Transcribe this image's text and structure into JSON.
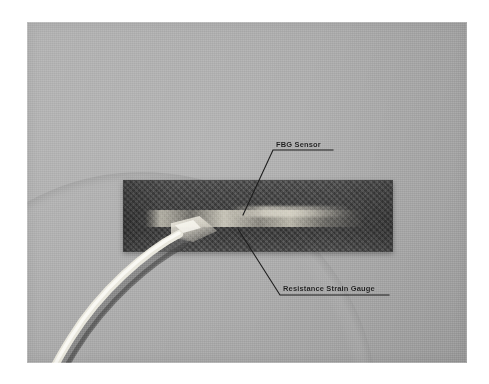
{
  "figure": {
    "type": "photograph",
    "background_color": "#a9a9a9",
    "specimen_color": "#414141",
    "annotation_color": "#1d1d1d",
    "cable_color": "#f2f0e8"
  },
  "annotations": [
    {
      "id": "fbg-sensor",
      "label": "FBG Sensor",
      "leader": "from label underline left end, down-left into the centre of the specimen"
    },
    {
      "id": "resistance-strain-gauge",
      "label": "Resistance Strain Gauge",
      "leader": "from label underline left end, up-left into the lower centre of the specimen"
    }
  ],
  "objects": [
    {
      "id": "specimen",
      "name": "dark woven composite coupon"
    },
    {
      "id": "fibre-cable",
      "name": "white optical fibre lead curving to lower left"
    },
    {
      "id": "gauge-band",
      "name": "light bonded gauge / fibre band across specimen"
    }
  ]
}
